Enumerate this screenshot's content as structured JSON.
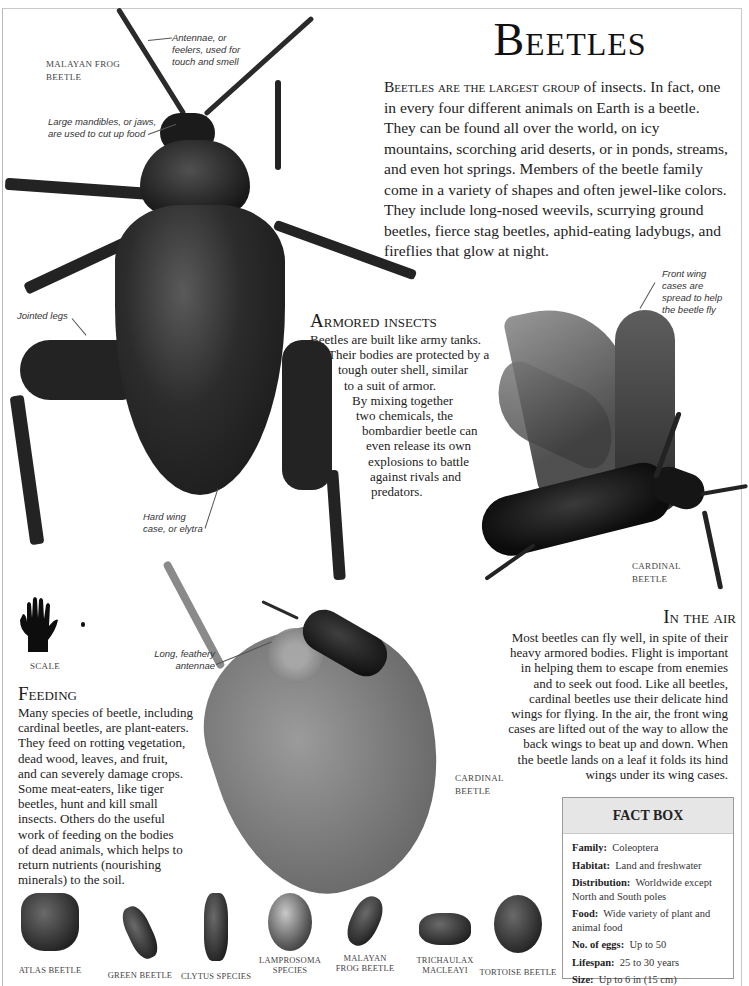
{
  "title": "Beetles",
  "intro": {
    "lead": "Beetles are the largest group",
    "text": " of insects. In fact, one in every four different animals on Earth is a beetle. They can be found all over the world, on icy mountains, scorching arid deserts, or in ponds, streams, and even hot springs. Members of the beetle family come in a variety of shapes and often jewel-like colors. They include long-nosed weevils, scurrying ground beetles, fierce stag beetles, aphid-eating ladybugs, and fireflies that glow at night."
  },
  "main_specimen": {
    "label_line1": "MALAYAN FROG",
    "label_line2": "BEETLE",
    "callouts": {
      "antennae": [
        "Antennae, or",
        "feelers, used for",
        "touch and smell"
      ],
      "mandibles": [
        "Large mandibles, or jaws,",
        "are used to cut up food"
      ],
      "legs": [
        "Jointed legs"
      ],
      "wing_case": [
        "Hard wing",
        "case, or elytra"
      ]
    }
  },
  "armored": {
    "heading": "Armored insects",
    "lines": [
      "Beetles are built like army tanks.",
      "Their bodies are protected by a",
      "tough outer shell, similar",
      "to a suit of armor.",
      "By mixing together",
      "two chemicals, the",
      "bombardier beetle can",
      "even release its own",
      "explosions to battle",
      "against rivals and",
      "predators."
    ]
  },
  "flying_specimen": {
    "callout": [
      "Front wing",
      "cases are",
      "spread to help",
      "the beetle fly"
    ],
    "label_line1": "CARDINAL",
    "label_line2": "BEETLE"
  },
  "in_the_air": {
    "heading": "In the air",
    "lines": [
      "Most beetles can fly well, in spite of their",
      "heavy armored bodies. Flight is important",
      "in helping them to escape from enemies",
      "and to seek out food. Like all beetles,",
      "cardinal beetles use their delicate hind",
      "wings for flying. In the air, the front wing",
      "cases are lifted out of the way to allow the",
      "back wings to beat up and down. When",
      "the beetle lands on a leaf it folds its hind",
      "wings under its wing cases."
    ]
  },
  "scale": {
    "label": "SCALE"
  },
  "leaf_specimen": {
    "callout": [
      "Long, feathery",
      "antennae"
    ],
    "label_line1": "CARDINAL",
    "label_line2": "BEETLE"
  },
  "feeding": {
    "heading": "Feeding",
    "lines": [
      "Many species of beetle, including",
      "cardinal beetles, are plant-eaters.",
      "They feed on rotting vegetation,",
      "dead wood, leaves, and fruit,",
      "and can severely damage crops.",
      "Some meat-eaters, like tiger",
      "beetles, hunt and kill small",
      "insects. Others do the useful",
      "work of feeding on the bodies",
      "of dead animals, which helps to",
      "return nutrients (nourishing",
      "minerals) to the soil."
    ]
  },
  "fact_box": {
    "heading": "FACT BOX",
    "rows": [
      {
        "key": "Family:",
        "value": "Coleoptera"
      },
      {
        "key": "Habitat:",
        "value": "Land and freshwater"
      },
      {
        "key": "Distribution:",
        "value": "Worldwide except North and South poles"
      },
      {
        "key": "Food:",
        "value": "Wide variety of plant and animal food"
      },
      {
        "key": "No. of eggs:",
        "value": "Up to 50"
      },
      {
        "key": "Lifespan:",
        "value": "25 to 30 years"
      },
      {
        "key": "Size:",
        "value": "Up to 6 in (15 cm)"
      }
    ]
  },
  "species_strip": [
    {
      "label_line1": "ATLAS BEETLE",
      "label_line2": ""
    },
    {
      "label_line1": "GREEN BEETLE",
      "label_line2": ""
    },
    {
      "label_line1": "CLYTUS SPECIES",
      "label_line2": ""
    },
    {
      "label_line1": "LAMPROSOMA",
      "label_line2": "SPECIES"
    },
    {
      "label_line1": "MALAYAN",
      "label_line2": "FROG BEETLE"
    },
    {
      "label_line1": "TRICHAULAX",
      "label_line2": "MACLEAYI"
    },
    {
      "label_line1": "TORTOISE BEETLE",
      "label_line2": ""
    }
  ]
}
